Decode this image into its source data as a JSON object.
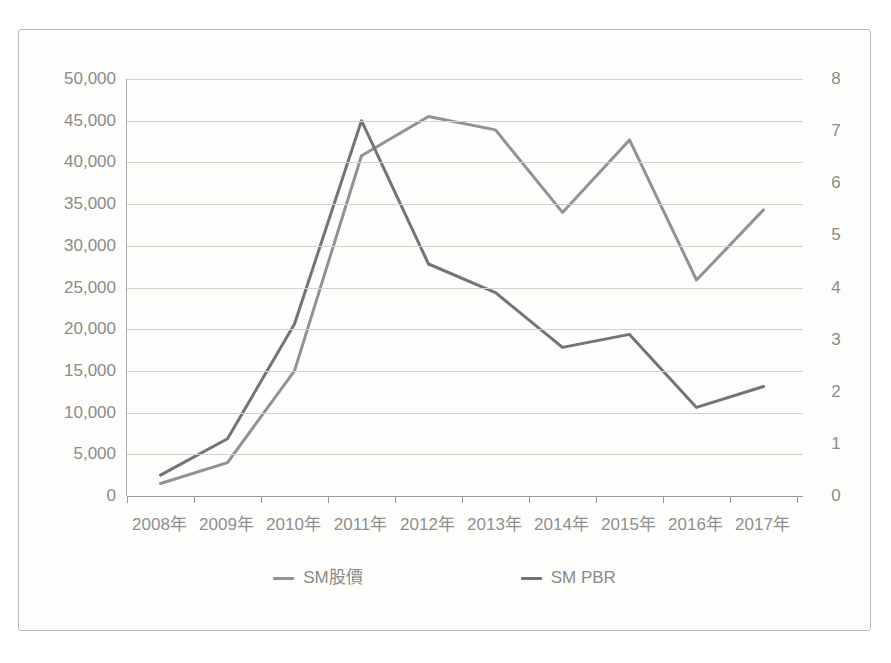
{
  "figure": {
    "background_color": "#fdfdfb",
    "border_color": "#bbbbb6",
    "axis_label_color": "#8b8b8b",
    "gridline_color": "#d2d2cc"
  },
  "chart_data": {
    "type": "line",
    "title": "",
    "categories": [
      "2008年",
      "2009年",
      "2010年",
      "2011年",
      "2012年",
      "2013年",
      "2014年",
      "2015年",
      "2016年",
      "2017年"
    ],
    "series": [
      {
        "name": "SM股價",
        "axis": "left",
        "color": "#929292",
        "values": [
          1500,
          4000,
          15000,
          40800,
          45500,
          43900,
          34000,
          42700,
          25900,
          34300
        ]
      },
      {
        "name": "SM PBR",
        "axis": "right",
        "color": "#747474",
        "values": [
          0.4,
          1.1,
          3.3,
          7.2,
          4.45,
          3.9,
          2.85,
          3.1,
          1.7,
          2.1
        ]
      }
    ],
    "left_axis": {
      "min": 0,
      "max": 50000,
      "step": 5000,
      "tick_labels": [
        "0",
        "5,000",
        "10,000",
        "15,000",
        "20,000",
        "25,000",
        "30,000",
        "35,000",
        "40,000",
        "45,000",
        "50,000"
      ]
    },
    "right_axis": {
      "min": 0,
      "max": 8,
      "step": 1,
      "tick_labels": [
        "0",
        "1",
        "2",
        "3",
        "4",
        "5",
        "6",
        "7",
        "8"
      ]
    },
    "grid": true,
    "legend_position": "bottom"
  }
}
